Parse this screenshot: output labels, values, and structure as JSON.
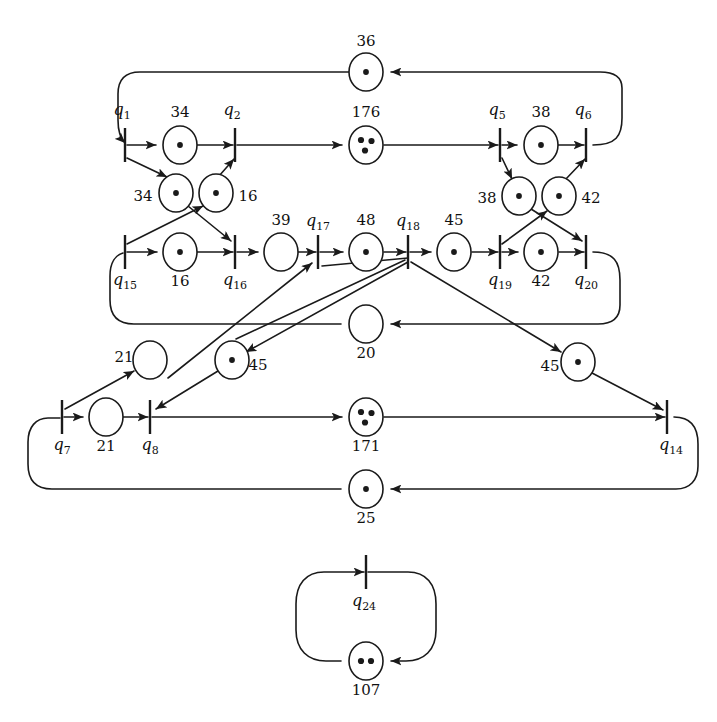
{
  "diagram": {
    "stroke_color": "#1a1a1a",
    "background_color": "#ffffff"
  },
  "transitions": [
    {
      "id": "q1",
      "label": "q",
      "sub": "1",
      "x": 125,
      "y": 145,
      "lx": 122,
      "ly": 111
    },
    {
      "id": "q2",
      "label": "q",
      "sub": "2",
      "x": 235,
      "y": 145,
      "lx": 232,
      "ly": 111
    },
    {
      "id": "q5",
      "label": "q",
      "sub": "5",
      "x": 500,
      "y": 145,
      "lx": 497,
      "ly": 111
    },
    {
      "id": "q6",
      "label": "q",
      "sub": "6",
      "x": 586,
      "y": 145,
      "lx": 583,
      "ly": 111
    },
    {
      "id": "q15",
      "label": "q",
      "sub": "15",
      "x": 125,
      "y": 252,
      "lx": 125,
      "ly": 281
    },
    {
      "id": "q16",
      "label": "q",
      "sub": "16",
      "x": 235,
      "y": 252,
      "lx": 235,
      "ly": 281
    },
    {
      "id": "q17",
      "label": "q",
      "sub": "17",
      "x": 318,
      "y": 252,
      "lx": 318,
      "ly": 222
    },
    {
      "id": "q18",
      "label": "q",
      "sub": "18",
      "x": 408,
      "y": 252,
      "lx": 408,
      "ly": 222
    },
    {
      "id": "q19",
      "label": "q",
      "sub": "19",
      "x": 500,
      "y": 252,
      "lx": 500,
      "ly": 281
    },
    {
      "id": "q20",
      "label": "q",
      "sub": "20",
      "x": 586,
      "y": 252,
      "lx": 586,
      "ly": 281
    },
    {
      "id": "q7",
      "label": "q",
      "sub": "7",
      "x": 62,
      "y": 417,
      "lx": 62,
      "ly": 446
    },
    {
      "id": "q8",
      "label": "q",
      "sub": "8",
      "x": 150,
      "y": 417,
      "lx": 150,
      "ly": 446
    },
    {
      "id": "q14",
      "label": "q",
      "sub": "14",
      "x": 667,
      "y": 417,
      "lx": 671,
      "ly": 446
    },
    {
      "id": "q24",
      "label": "q",
      "sub": "24",
      "x": 366,
      "y": 572,
      "lx": 364,
      "ly": 602
    }
  ],
  "places": [
    {
      "id": "p36",
      "label": "36",
      "tokens": 1,
      "x": 366,
      "y": 72,
      "lx": 366,
      "ly": 41
    },
    {
      "id": "p34a",
      "label": "34",
      "tokens": 1,
      "x": 180,
      "y": 145,
      "lx": 180,
      "ly": 112
    },
    {
      "id": "p176",
      "label": "176",
      "tokens": 3,
      "x": 366,
      "y": 145,
      "lx": 366,
      "ly": 112
    },
    {
      "id": "p38a",
      "label": "38",
      "tokens": 1,
      "x": 541,
      "y": 145,
      "lx": 541,
      "ly": 112
    },
    {
      "id": "p34b",
      "label": "34",
      "tokens": 1,
      "x": 176,
      "y": 193,
      "lx": 143,
      "ly": 196
    },
    {
      "id": "p16a",
      "label": "16",
      "tokens": 1,
      "x": 216,
      "y": 193,
      "lx": 248,
      "ly": 196
    },
    {
      "id": "p38b",
      "label": "38",
      "tokens": 1,
      "x": 519,
      "y": 196,
      "lx": 487,
      "ly": 198
    },
    {
      "id": "p42a",
      "label": "42",
      "tokens": 1,
      "x": 559,
      "y": 196,
      "lx": 591,
      "ly": 198
    },
    {
      "id": "p16b",
      "label": "16",
      "tokens": 1,
      "x": 180,
      "y": 252,
      "lx": 180,
      "ly": 281
    },
    {
      "id": "p39",
      "label": "39",
      "tokens": 0,
      "x": 281,
      "y": 252,
      "lx": 281,
      "ly": 220
    },
    {
      "id": "p48",
      "label": "48",
      "tokens": 1,
      "x": 366,
      "y": 252,
      "lx": 366,
      "ly": 220
    },
    {
      "id": "p45a",
      "label": "45",
      "tokens": 1,
      "x": 454,
      "y": 252,
      "lx": 454,
      "ly": 220
    },
    {
      "id": "p42b",
      "label": "42",
      "tokens": 1,
      "x": 541,
      "y": 252,
      "lx": 541,
      "ly": 281
    },
    {
      "id": "p20",
      "label": "20",
      "tokens": 0,
      "x": 366,
      "y": 324,
      "lx": 366,
      "ly": 353
    },
    {
      "id": "p21a",
      "label": "21",
      "tokens": 0,
      "x": 150,
      "y": 360,
      "lx": 124,
      "ly": 357
    },
    {
      "id": "p45b",
      "label": "45",
      "tokens": 1,
      "x": 232,
      "y": 360,
      "lx": 258,
      "ly": 365
    },
    {
      "id": "p45c",
      "label": "45",
      "tokens": 1,
      "x": 578,
      "y": 362,
      "lx": 550,
      "ly": 366
    },
    {
      "id": "p21b",
      "label": "21",
      "tokens": 0,
      "x": 106,
      "y": 417,
      "lx": 106,
      "ly": 446
    },
    {
      "id": "p171",
      "label": "171",
      "tokens": 3,
      "x": 366,
      "y": 417,
      "lx": 366,
      "ly": 446
    },
    {
      "id": "p25",
      "label": "25",
      "tokens": 1,
      "x": 366,
      "y": 489,
      "lx": 366,
      "ly": 518
    },
    {
      "id": "p107",
      "label": "107",
      "tokens": 2,
      "x": 366,
      "y": 661,
      "lx": 366,
      "ly": 690
    }
  ],
  "geometry": {
    "place_rx": 17,
    "place_ry": 19,
    "transition_half_height": 17,
    "stroke_width": 1.6
  }
}
